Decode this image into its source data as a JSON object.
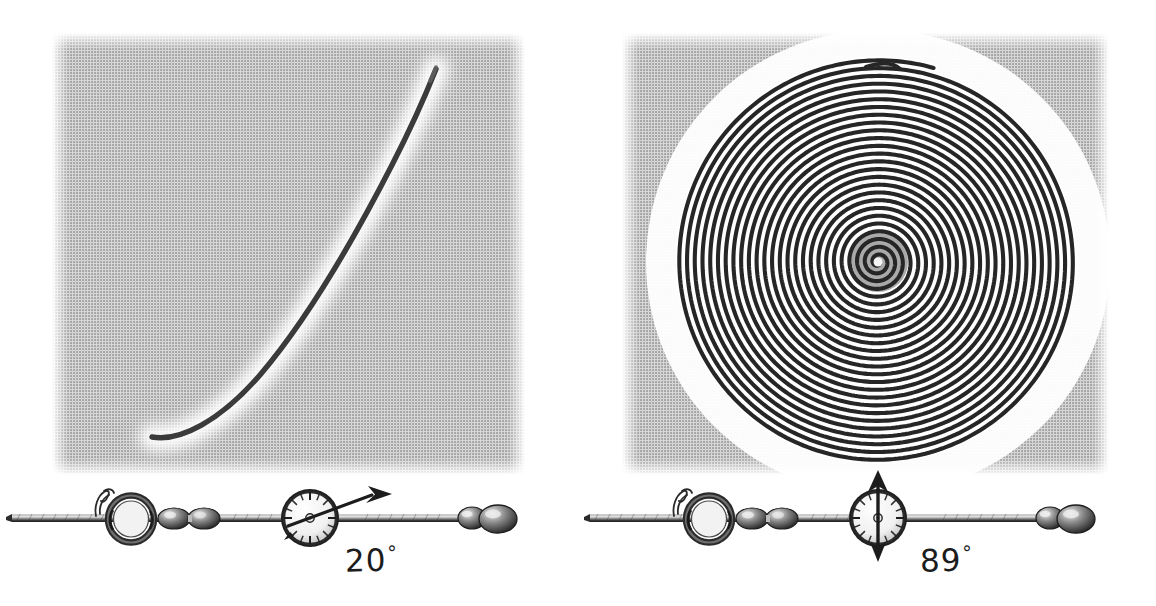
{
  "figure": {
    "background_color": "#ffffff",
    "panel_fill": "#d2d2d2",
    "ink_color": "#262626",
    "trace_color": "#3a3a3a"
  },
  "panels": [
    {
      "id": "left",
      "name": "plate-20-degrees",
      "angle_label": "20",
      "degree_symbol": "°",
      "trace_type": "open-arc",
      "panel_rect": {
        "x": 52,
        "y": 33,
        "width": 473,
        "height": 442
      },
      "trace_description": "single open curved arc sweeping from lower-left to upper-right",
      "curve_endpoints": {
        "start": [
          152,
          437
        ],
        "end": [
          436,
          69
        ]
      },
      "apparatus": {
        "name": "inclined-rod-assembly",
        "parts": [
          "rod",
          "wire-hook",
          "ring",
          "bead-pair",
          "compass-dial",
          "pointer-needle",
          "end-weight"
        ],
        "needle_angle_deg": 20,
        "baseline_y": 518
      }
    },
    {
      "id": "right",
      "name": "plate-89-degrees",
      "angle_label": "89",
      "degree_symbol": "°",
      "trace_type": "spiral",
      "panel_rect": {
        "x": 622,
        "y": 33,
        "width": 487,
        "height": 442
      },
      "trace_description": "tight multi-turn archimedean spiral filling the plate",
      "spiral_center": [
        878,
        262
      ],
      "spiral_turns": 26,
      "spiral_outer_radius": 198,
      "spiral_outer_end": [
        900,
        63
      ],
      "apparatus": {
        "name": "inclined-rod-assembly",
        "parts": [
          "rod",
          "wire-hook",
          "ring",
          "bead-pair",
          "compass-dial",
          "pointer-needle",
          "end-weight"
        ],
        "needle_angle_deg": 89,
        "baseline_y": 518
      }
    }
  ],
  "chart_data": {
    "type": "line",
    "xlabel": "",
    "ylabel": "",
    "grid": false,
    "legend": "none",
    "series": [
      {
        "name": "20° trace",
        "kind": "open-arc",
        "turns": 0.25,
        "annotation": "20°"
      },
      {
        "name": "89° trace",
        "kind": "spiral",
        "turns": 26,
        "annotation": "89°"
      }
    ]
  }
}
